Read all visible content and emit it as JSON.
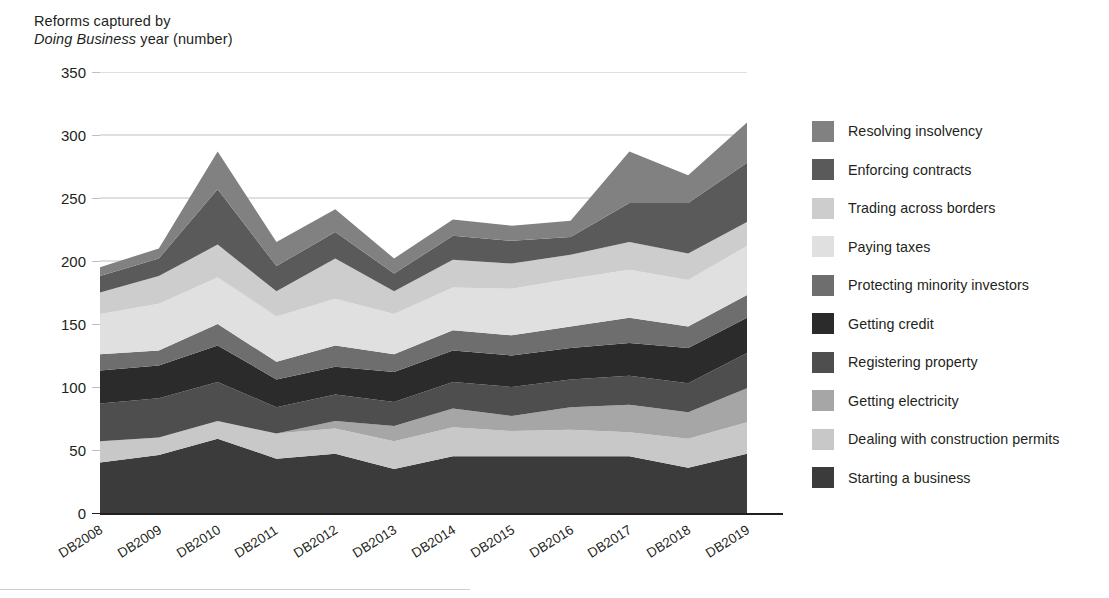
{
  "chart_data": {
    "type": "area",
    "stacked": true,
    "title": "Reforms captured by Doing Business year (number)",
    "title_line1": "Reforms captured by",
    "title_line2_italic": "Doing Business",
    "title_line2_rest": " year (number)",
    "xlabel": "",
    "ylabel": "Reforms captured by Doing Business year (number)",
    "categories": [
      "DB2008",
      "DB2009",
      "DB2010",
      "DB2011",
      "DB2012",
      "DB2013",
      "DB2014",
      "DB2015",
      "DB2016",
      "DB2017",
      "DB2018",
      "DB2019"
    ],
    "ylim": [
      0,
      350
    ],
    "yticks": [
      0,
      50,
      100,
      150,
      200,
      250,
      300,
      350
    ],
    "grid": true,
    "legend_position": "right",
    "series": [
      {
        "name": "Starting a business",
        "color": "#3b3b3b",
        "values": [
          40,
          46,
          59,
          43,
          47,
          35,
          45,
          45,
          45,
          45,
          36,
          47
        ]
      },
      {
        "name": "Dealing with construction permits",
        "color": "#c8c8c8",
        "values": [
          17,
          14,
          14,
          20,
          20,
          22,
          23,
          20,
          21,
          19,
          23,
          25
        ]
      },
      {
        "name": "Getting electricity",
        "color": "#a6a6a6",
        "values": [
          0,
          0,
          0,
          0,
          6,
          12,
          15,
          12,
          18,
          22,
          21,
          27
        ]
      },
      {
        "name": "Registering property",
        "color": "#4e4e4e",
        "values": [
          30,
          31,
          31,
          21,
          21,
          19,
          21,
          23,
          22,
          23,
          23,
          28
        ]
      },
      {
        "name": "Getting credit",
        "color": "#2b2b2b",
        "values": [
          26,
          26,
          29,
          22,
          22,
          24,
          25,
          25,
          25,
          26,
          28,
          28
        ]
      },
      {
        "name": "Protecting minority investors",
        "color": "#6e6e6e",
        "values": [
          13,
          12,
          17,
          14,
          17,
          14,
          16,
          16,
          17,
          20,
          17,
          18
        ]
      },
      {
        "name": "Paying taxes",
        "color": "#e0e0e0",
        "values": [
          32,
          37,
          37,
          36,
          37,
          32,
          34,
          37,
          38,
          38,
          37,
          39
        ]
      },
      {
        "name": "Trading across borders",
        "color": "#cdcdcd",
        "values": [
          17,
          22,
          26,
          20,
          32,
          18,
          22,
          20,
          19,
          22,
          21,
          19
        ]
      },
      {
        "name": "Enforcing contracts",
        "color": "#5a5a5a",
        "values": [
          13,
          14,
          44,
          20,
          21,
          14,
          19,
          18,
          14,
          31,
          40,
          47
        ]
      },
      {
        "name": "Resolving insolvency",
        "color": "#818181",
        "values": [
          7,
          8,
          30,
          19,
          18,
          12,
          13,
          12,
          13,
          41,
          22,
          32
        ]
      }
    ],
    "totals": [
      195,
      210,
      287,
      215,
      241,
      202,
      233,
      228,
      232,
      287,
      268,
      310
    ]
  },
  "legend": {
    "items": [
      {
        "label": "Resolving insolvency",
        "color": "#818181"
      },
      {
        "label": "Enforcing contracts",
        "color": "#5a5a5a"
      },
      {
        "label": "Trading across borders",
        "color": "#cdcdcd"
      },
      {
        "label": "Paying taxes",
        "color": "#e0e0e0"
      },
      {
        "label": "Protecting minority investors",
        "color": "#6e6e6e"
      },
      {
        "label": "Getting credit",
        "color": "#2b2b2b"
      },
      {
        "label": "Registering property",
        "color": "#4e4e4e"
      },
      {
        "label": "Getting electricity",
        "color": "#a6a6a6"
      },
      {
        "label": "Dealing with construction permits",
        "color": "#c8c8c8"
      },
      {
        "label": "Starting a business",
        "color": "#3b3b3b"
      }
    ]
  },
  "colors": {
    "text": "#231f20",
    "gridline": "#bfbfbf",
    "axis": "#231f20",
    "background": "#ffffff"
  }
}
